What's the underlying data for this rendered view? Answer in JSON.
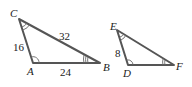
{
  "figure": {
    "triangle_1": {
      "name": "ABC",
      "vertices": {
        "A": "A",
        "B": "B",
        "C": "C"
      },
      "sides": {
        "CA": "16",
        "CB": "32",
        "AB": "24"
      },
      "angle_marks": {
        "A": "single arc",
        "C": "double arc",
        "B": "triple arc"
      }
    },
    "triangle_2": {
      "name": "DEF",
      "vertices": {
        "D": "D",
        "E": "E",
        "F": "F"
      },
      "sides": {
        "ED": "8"
      },
      "angle_marks": {
        "D": "single arc",
        "E": "double arc",
        "F": "triple arc"
      }
    },
    "colors": {
      "edge": "#555555",
      "text": "#222222",
      "background": "#ffffff"
    }
  }
}
